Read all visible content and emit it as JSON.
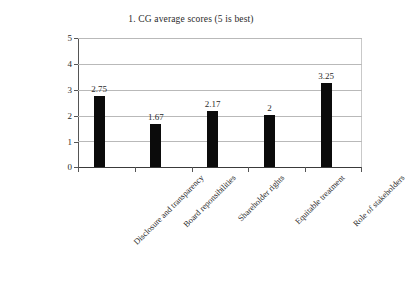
{
  "chart_data": {
    "type": "bar",
    "title": "1. CG average scores (5 is best)",
    "xlabel": "",
    "ylabel": "",
    "categories": [
      "Disclosure and transparency",
      "Board reponsibilities",
      "Shareholder rights",
      "Equitable treatment",
      "Role of stakeholders"
    ],
    "values": [
      2.75,
      1.67,
      2.17,
      2,
      3.25
    ],
    "value_labels": [
      "2.75",
      "1.67",
      "2.17",
      "2",
      "3.25"
    ],
    "ylim": [
      0,
      5
    ],
    "yticks": [
      "0",
      "1",
      "2",
      "3",
      "4",
      "5"
    ],
    "grid": "horizontal",
    "legend": "none",
    "bar_color": "#0b0b0b",
    "gridline_color": "#b9b9b9",
    "axis_color": "#555555",
    "text_color": "#2a2a2a",
    "background": "#ffffff"
  }
}
